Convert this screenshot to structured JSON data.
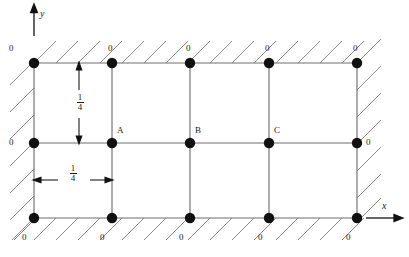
{
  "figure": {
    "type": "finite-difference-grid-diagram",
    "axes": {
      "x_label": "x",
      "y_label": "y"
    },
    "grid": {
      "columns_x": [
        34,
        112,
        190,
        269,
        357
      ],
      "rows_y": [
        63,
        143,
        218
      ],
      "node_radius": 5.2,
      "node_color": "#111111",
      "line_color": "#6f6f6f"
    },
    "boundary_value": "0",
    "boundary_labels": {
      "top": [
        "0",
        "0",
        "0",
        "0",
        "0"
      ],
      "bottom": [
        "0",
        "0",
        "0",
        "0",
        "0"
      ],
      "left": [
        "0"
      ],
      "right": [
        "0"
      ]
    },
    "interior_nodes": [
      {
        "label": "A",
        "x": 112,
        "y": 143
      },
      {
        "label": "B",
        "x": 190,
        "y": 143
      },
      {
        "label": "C",
        "x": 269,
        "y": 143
      }
    ],
    "dimensions": [
      {
        "orientation": "vertical",
        "numerator": "1",
        "denominator": "4",
        "from_y": 63,
        "to_y": 143,
        "at_x": 79
      },
      {
        "orientation": "horizontal",
        "numerator": "1",
        "denominator": "4",
        "from_x": 34,
        "to_x": 112,
        "at_y": 180
      }
    ],
    "hatching": {
      "angle_deg": 45,
      "color": "#7d7d7d",
      "sides": [
        "top",
        "bottom",
        "left",
        "right"
      ]
    }
  }
}
